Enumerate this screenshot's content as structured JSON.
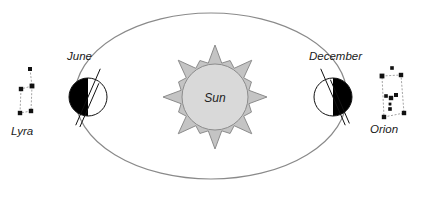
{
  "diagram": {
    "background_color": "#ffffff"
  },
  "sun": {
    "label": "Sun",
    "center": {
      "x": 215,
      "y": 97
    },
    "corona_radius": 52,
    "core_radius": 33,
    "corona_color": "#c4c4c4",
    "core_color": "#d9d9d9",
    "stroke_color": "#8c8c8c"
  },
  "orbit": {
    "name": "orbit-ellipse",
    "center": {
      "x": 211,
      "y": 96
    },
    "radius_x": 136,
    "radius_y": 83,
    "stroke_color": "#8a8a8a",
    "stroke_width": 1.2
  },
  "earths": [
    {
      "id": "june",
      "label": "June",
      "label_position": {
        "x": 67,
        "y": 60
      },
      "center": {
        "x": 88,
        "y": 97
      },
      "radius": 19,
      "night_side": "left",
      "axis_tilt_deg": 23.5,
      "night_color": "#000000",
      "day_color": "#ffffff",
      "stroke_color": "#111111"
    },
    {
      "id": "december",
      "label": "December",
      "label_position": {
        "x": 309,
        "y": 60
      },
      "center": {
        "x": 333,
        "y": 97
      },
      "radius": 19,
      "night_side": "right",
      "axis_tilt_deg": -23.5,
      "night_color": "#000000",
      "day_color": "#ffffff",
      "stroke_color": "#111111"
    }
  ],
  "constellations": [
    {
      "id": "lyra",
      "label": "Lyra",
      "label_position": {
        "x": 11,
        "y": 135
      },
      "star_color": "#111111",
      "line_color": "#9a9a9a",
      "stars": [
        {
          "x": 30,
          "y": 69,
          "r": 2.0
        },
        {
          "x": 32,
          "y": 86,
          "r": 2.4
        },
        {
          "x": 21,
          "y": 89,
          "r": 2.2
        },
        {
          "x": 31,
          "y": 111,
          "r": 2.2
        },
        {
          "x": 20,
          "y": 113,
          "r": 2.2
        }
      ],
      "links": [
        [
          0,
          1
        ],
        [
          1,
          2
        ],
        [
          1,
          3
        ],
        [
          3,
          4
        ],
        [
          4,
          2
        ]
      ]
    },
    {
      "id": "orion",
      "label": "Orion",
      "label_position": {
        "x": 370,
        "y": 133
      },
      "star_color": "#111111",
      "line_color": "#9a9a9a",
      "stars": [
        {
          "x": 392,
          "y": 68,
          "r": 1.8
        },
        {
          "x": 382,
          "y": 76,
          "r": 2.4
        },
        {
          "x": 401,
          "y": 75,
          "r": 2.2
        },
        {
          "x": 386,
          "y": 96,
          "r": 1.8
        },
        {
          "x": 391,
          "y": 98,
          "r": 2.2
        },
        {
          "x": 396,
          "y": 95,
          "r": 2.0
        },
        {
          "x": 390,
          "y": 104,
          "r": 1.4
        },
        {
          "x": 390,
          "y": 109,
          "r": 1.8
        },
        {
          "x": 384,
          "y": 117,
          "r": 2.2
        },
        {
          "x": 404,
          "y": 113,
          "r": 2.2
        }
      ],
      "box": [
        {
          "x": 382,
          "y": 76
        },
        {
          "x": 401,
          "y": 75
        },
        {
          "x": 404,
          "y": 113
        },
        {
          "x": 384,
          "y": 117
        }
      ],
      "links": [
        [
          3,
          4
        ],
        [
          4,
          5
        ],
        [
          6,
          7
        ]
      ]
    }
  ]
}
